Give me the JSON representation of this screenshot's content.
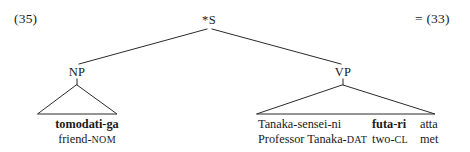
{
  "figure": {
    "example_number": "(35)",
    "cross_reference": "= (33)"
  },
  "tree": {
    "root": {
      "label": "*S"
    },
    "nodes": [
      {
        "label": "NP"
      },
      {
        "label": "VP"
      }
    ],
    "np": {
      "label": "NP",
      "form": "tomodati-ga",
      "gloss_stem": "friend-",
      "gloss_tag": "NOM"
    },
    "vp": {
      "label": "VP",
      "form_1": "Tanaka-sensei-ni",
      "form_2": "futa-ri",
      "form_3": "atta",
      "gloss_1_stem": "Professor Tanaka-",
      "gloss_1_tag": "DAT",
      "gloss_2_stem": "two-",
      "gloss_2_tag": "CL",
      "gloss_3": "met"
    }
  },
  "colors": {
    "background": "#ffffff",
    "ink": "#1a1a1a",
    "line": "#2b2b2b"
  }
}
